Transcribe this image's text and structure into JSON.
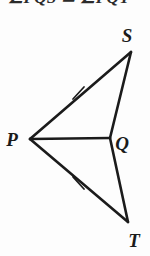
{
  "figure": {
    "caption_partial": "∠PQS ≅ ∠PQT",
    "background_color": "#fdfdfd",
    "stroke_color": "#1b1b1b",
    "label_color": "#1b1b1b"
  },
  "labels": {
    "p": "P",
    "q": "Q",
    "s": "S",
    "t": "T"
  },
  "geometry": {
    "type": "dart-quadrilateral",
    "vertices": [
      {
        "name": "P",
        "x": 30,
        "y": 139
      },
      {
        "name": "S",
        "x": 131,
        "y": 52
      },
      {
        "name": "Q",
        "x": 110,
        "y": 138
      },
      {
        "name": "T",
        "x": 128,
        "y": 222
      }
    ],
    "segments": [
      {
        "name": "PS",
        "from": "P",
        "to": "S",
        "tick_marks": 1
      },
      {
        "name": "SQ",
        "from": "S",
        "to": "Q",
        "tick_marks": 0
      },
      {
        "name": "PQ",
        "from": "P",
        "to": "Q",
        "tick_marks": 0
      },
      {
        "name": "QT",
        "from": "Q",
        "to": "T",
        "tick_marks": 0
      },
      {
        "name": "PT",
        "from": "P",
        "to": "T",
        "tick_marks": 1
      }
    ],
    "tick_marks": [
      {
        "on_segment": "PS",
        "x": 78,
        "y": 93
      },
      {
        "on_segment": "PT",
        "x": 78,
        "y": 183
      }
    ],
    "label_positions": [
      {
        "name": "P",
        "x": 12,
        "y": 146
      },
      {
        "name": "S",
        "x": 125,
        "y": 42
      },
      {
        "name": "Q",
        "x": 116,
        "y": 150
      },
      {
        "name": "T",
        "x": 130,
        "y": 247
      }
    ]
  }
}
